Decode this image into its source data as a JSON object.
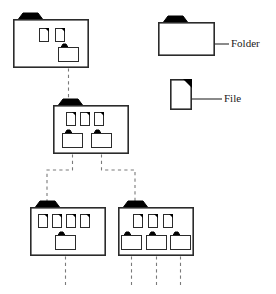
{
  "diagram": {
    "stroke_color": "#2b2b2b",
    "fill_color": "#ffffff",
    "tab_color": "#000000",
    "dash_color": "#7a7a7a",
    "legend": {
      "folder": {
        "label": "Folder",
        "icon": "folder-icon",
        "x": 158,
        "y": 22,
        "w": 57,
        "h": 34,
        "leader_x1": 215,
        "leader_x2": 229,
        "leader_y": 44,
        "label_x": 231,
        "label_y": 47
      },
      "file": {
        "label": "File",
        "icon": "file-icon",
        "x": 170,
        "y": 79,
        "w": 22,
        "h": 31,
        "leader_x1": 192,
        "leader_x2": 222,
        "leader_y": 99,
        "label_x": 224,
        "label_y": 102
      }
    },
    "nodes": [
      {
        "id": "root",
        "name": "root-folder",
        "level": 1,
        "x": 13,
        "y": 19,
        "w": 76,
        "h": 49,
        "tab": {
          "x": 17,
          "y": 13,
          "w": 27,
          "h": 7
        },
        "files": [
          {
            "name": "file-icon",
            "x": 39,
            "y": 28,
            "w": 10,
            "h": 14
          },
          {
            "name": "file-icon",
            "x": 55,
            "y": 28,
            "w": 10,
            "h": 14
          }
        ],
        "subfolders": [
          {
            "name": "subfolder-icon",
            "x": 58,
            "y": 47,
            "w": 21,
            "h": 15,
            "tab": {
              "x": 60,
              "y": 44,
              "w": 9,
              "h": 4
            }
          }
        ]
      },
      {
        "id": "mid",
        "name": "level2-folder",
        "level": 2,
        "x": 53,
        "y": 105,
        "w": 76,
        "h": 49,
        "tab": {
          "x": 57,
          "y": 99,
          "w": 27,
          "h": 7
        },
        "files": [
          {
            "name": "file-icon",
            "x": 66,
            "y": 112,
            "w": 10,
            "h": 14
          },
          {
            "name": "file-icon",
            "x": 80,
            "y": 112,
            "w": 10,
            "h": 14
          },
          {
            "name": "file-icon",
            "x": 94,
            "y": 112,
            "w": 10,
            "h": 14
          }
        ],
        "subfolders": [
          {
            "name": "subfolder-icon",
            "x": 62,
            "y": 133,
            "w": 21,
            "h": 15,
            "tab": {
              "x": 64,
              "y": 130,
              "w": 9,
              "h": 4
            }
          },
          {
            "name": "subfolder-icon",
            "x": 91,
            "y": 133,
            "w": 21,
            "h": 15,
            "tab": {
              "x": 93,
              "y": 130,
              "w": 9,
              "h": 4
            }
          }
        ]
      },
      {
        "id": "leaf-left",
        "name": "level3-left-folder",
        "level": 3,
        "x": 30,
        "y": 207,
        "w": 76,
        "h": 49,
        "tab": {
          "x": 34,
          "y": 201,
          "w": 27,
          "h": 7
        },
        "files": [
          {
            "name": "file-icon",
            "x": 38,
            "y": 214,
            "w": 10,
            "h": 14
          },
          {
            "name": "file-icon",
            "x": 52,
            "y": 214,
            "w": 10,
            "h": 14
          },
          {
            "name": "file-icon",
            "x": 66,
            "y": 214,
            "w": 10,
            "h": 14
          },
          {
            "name": "file-icon",
            "x": 80,
            "y": 214,
            "w": 10,
            "h": 14
          }
        ],
        "subfolders": [
          {
            "name": "subfolder-icon",
            "x": 55,
            "y": 235,
            "w": 21,
            "h": 15,
            "tab": {
              "x": 57,
              "y": 232,
              "w": 9,
              "h": 4
            }
          }
        ]
      },
      {
        "id": "leaf-right",
        "name": "level3-right-folder",
        "level": 3,
        "x": 118,
        "y": 207,
        "w": 76,
        "h": 49,
        "tab": {
          "x": 122,
          "y": 201,
          "w": 27,
          "h": 7
        },
        "files": [
          {
            "name": "file-icon",
            "x": 133,
            "y": 214,
            "w": 10,
            "h": 14
          },
          {
            "name": "file-icon",
            "x": 148,
            "y": 214,
            "w": 10,
            "h": 14
          },
          {
            "name": "file-icon",
            "x": 163,
            "y": 214,
            "w": 10,
            "h": 14
          }
        ],
        "subfolders": [
          {
            "name": "subfolder-icon",
            "x": 121,
            "y": 235,
            "w": 21,
            "h": 15,
            "tab": {
              "x": 123,
              "y": 232,
              "w": 9,
              "h": 4
            }
          },
          {
            "name": "subfolder-icon",
            "x": 146,
            "y": 235,
            "w": 21,
            "h": 15,
            "tab": {
              "x": 148,
              "y": 232,
              "w": 9,
              "h": 4
            }
          },
          {
            "name": "subfolder-icon",
            "x": 170,
            "y": 235,
            "w": 21,
            "h": 15,
            "tab": {
              "x": 172,
              "y": 232,
              "w": 9,
              "h": 4
            }
          }
        ]
      }
    ],
    "connectors": [
      {
        "name": "connector-root-to-mid",
        "path": "M 68.5 62 L 68.5 99"
      },
      {
        "name": "connector-mid-to-left",
        "path": "M 72.5 148 L 72.5 170 L 47 170 L 47 201"
      },
      {
        "name": "connector-mid-to-right",
        "path": "M 101.5 148 L 101.5 170 L 135 170 L 135 201"
      },
      {
        "name": "stub-left-1",
        "path": "M 65.5 250 L 65.5 285"
      },
      {
        "name": "stub-right-1",
        "path": "M 131.5 250 L 131.5 285"
      },
      {
        "name": "stub-right-2",
        "path": "M 156.5 250 L 156.5 285"
      },
      {
        "name": "stub-right-3",
        "path": "M 180.5 250 L 180.5 285"
      }
    ]
  }
}
